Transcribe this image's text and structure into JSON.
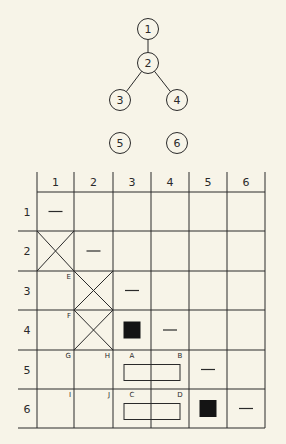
{
  "colors": {
    "background": "#f7f4e8",
    "ink": "#2a2a2a",
    "fill": "#141414"
  },
  "graph": {
    "nodes": [
      {
        "id": "1",
        "label": "1"
      },
      {
        "id": "2",
        "label": "2"
      },
      {
        "id": "3",
        "label": "3"
      },
      {
        "id": "4",
        "label": "4"
      },
      {
        "id": "5",
        "label": "5"
      },
      {
        "id": "6",
        "label": "6"
      }
    ],
    "edges": [
      {
        "from": "1",
        "to": "2"
      },
      {
        "from": "2",
        "to": "3"
      },
      {
        "from": "2",
        "to": "4"
      }
    ]
  },
  "matrix": {
    "column_headers": [
      "1",
      "2",
      "3",
      "4",
      "5",
      "6"
    ],
    "row_headers": [
      "1",
      "2",
      "3",
      "4",
      "5",
      "6"
    ],
    "diagonal_mark": "—",
    "crossed_cells": [
      {
        "row": 2,
        "col": 1
      },
      {
        "row": 3,
        "col": 2
      },
      {
        "row": 4,
        "col": 2
      }
    ],
    "filled_cells": [
      {
        "row": 4,
        "col": 3
      },
      {
        "row": 6,
        "col": 5
      }
    ],
    "corner_labels": [
      {
        "text": "E",
        "row": 3,
        "col": 1
      },
      {
        "text": "F",
        "row": 4,
        "col": 1
      },
      {
        "text": "G",
        "row": 5,
        "col": 1
      },
      {
        "text": "H",
        "row": 5,
        "col": 2
      },
      {
        "text": "I",
        "row": 6,
        "col": 1
      },
      {
        "text": "J",
        "row": 6,
        "col": 2
      },
      {
        "text": "A",
        "row": 5,
        "col": 3,
        "pos": "left"
      },
      {
        "text": "B",
        "row": 5,
        "col": 4,
        "pos": "left"
      },
      {
        "text": "C",
        "row": 6,
        "col": 3,
        "pos": "left"
      },
      {
        "text": "D",
        "row": 6,
        "col": 4,
        "pos": "left"
      }
    ],
    "spanning_boxes": [
      {
        "row": 5,
        "col_start": 3,
        "col_end": 4,
        "labels": [
          "A",
          "B"
        ]
      },
      {
        "row": 6,
        "col_start": 3,
        "col_end": 4,
        "labels": [
          "C",
          "D"
        ]
      }
    ]
  }
}
